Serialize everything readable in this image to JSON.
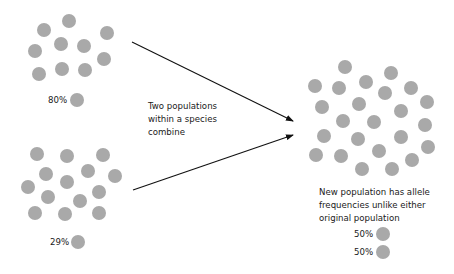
{
  "colors": {
    "dot": "#a9a9a9",
    "arrow": "#111111",
    "text": "#1a1a1a"
  },
  "dot_radius": 7,
  "population_a": {
    "label": "80%",
    "label_pos": [
      48,
      95
    ],
    "legend_dot": [
      77,
      100
    ],
    "dots": [
      [
        69,
        21
      ],
      [
        44,
        30
      ],
      [
        107,
        33
      ],
      [
        61,
        44
      ],
      [
        84,
        46
      ],
      [
        35,
        51
      ],
      [
        104,
        59
      ],
      [
        39,
        74
      ],
      [
        62,
        69
      ],
      [
        85,
        70
      ]
    ]
  },
  "population_b": {
    "label": "29%",
    "label_pos": [
      50,
      237
    ],
    "legend_dot": [
      78,
      242
    ],
    "dots": [
      [
        37,
        154
      ],
      [
        67,
        156
      ],
      [
        103,
        155
      ],
      [
        46,
        174
      ],
      [
        88,
        171
      ],
      [
        115,
        176
      ],
      [
        28,
        187
      ],
      [
        67,
        182
      ],
      [
        48,
        197
      ],
      [
        99,
        192
      ],
      [
        80,
        201
      ],
      [
        35,
        213
      ],
      [
        65,
        214
      ],
      [
        99,
        213
      ]
    ]
  },
  "combine_caption": {
    "lines": [
      "Two populations",
      "within a species",
      "combine"
    ]
  },
  "arrows": [
    {
      "from": [
        132,
        42
      ],
      "to": [
        293,
        121
      ]
    },
    {
      "from": [
        133,
        190
      ],
      "to": [
        293,
        135
      ]
    }
  ],
  "new_population": {
    "caption_lines": [
      "New population has allele",
      "frequencies unlike either",
      "original population"
    ],
    "dots": [
      [
        345,
        67
      ],
      [
        391,
        73
      ],
      [
        315,
        86
      ],
      [
        339,
        88
      ],
      [
        366,
        82
      ],
      [
        385,
        93
      ],
      [
        411,
        88
      ],
      [
        322,
        107
      ],
      [
        359,
        104
      ],
      [
        401,
        111
      ],
      [
        427,
        102
      ],
      [
        343,
        121
      ],
      [
        374,
        122
      ],
      [
        425,
        125
      ],
      [
        324,
        136
      ],
      [
        358,
        139
      ],
      [
        401,
        137
      ],
      [
        428,
        147
      ],
      [
        316,
        155
      ],
      [
        341,
        156
      ],
      [
        379,
        151
      ],
      [
        412,
        160
      ],
      [
        362,
        169
      ],
      [
        392,
        169
      ]
    ],
    "legend": [
      {
        "label": "50%",
        "label_pos": [
          354,
          228
        ],
        "dot": [
          383,
          234
        ]
      },
      {
        "label": "50%",
        "label_pos": [
          354,
          246
        ],
        "dot": [
          383,
          252
        ]
      }
    ]
  }
}
